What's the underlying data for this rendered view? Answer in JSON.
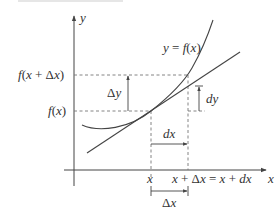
{
  "diagram": {
    "axes": {
      "x_label": "x",
      "y_label": "y"
    },
    "curve_label": "y = f(x)",
    "y_ticks": {
      "upper": "f(x + Δx)",
      "lower": "f(x)"
    },
    "x_ticks": {
      "left": "x",
      "right": "x + Δx = x + dx"
    },
    "annotations": {
      "delta_y": "Δy",
      "dy": "dy",
      "dx": "dx",
      "delta_x": "Δx"
    },
    "colors": {
      "line": "#444444",
      "dashed": "#777777",
      "text": "#333333",
      "background": "#ffffff"
    }
  }
}
